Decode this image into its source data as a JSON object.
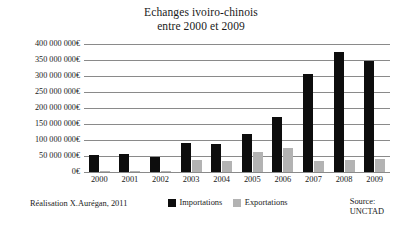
{
  "chart_data": {
    "type": "bar",
    "title": "Echanges ivoiro-chinois",
    "subtitle": "entre 2000 et 2009",
    "xlabel": "",
    "ylabel": "",
    "ylim": [
      0,
      400000000
    ],
    "ytick_step": 50000000,
    "grid": true,
    "legend_position": "bottom-center",
    "categories": [
      "2000",
      "2001",
      "2002",
      "2003",
      "2004",
      "2005",
      "2006",
      "2007",
      "2008",
      "2009"
    ],
    "ytick_labels": [
      "400 000 000€",
      "350 000 000€",
      "300 000 000€",
      "250 000 000€",
      "200 000 000€",
      "150 000 000€",
      "100 000 000€",
      "50 000 000€",
      "0€"
    ],
    "ytick_values": [
      400000000,
      350000000,
      300000000,
      250000000,
      200000000,
      150000000,
      100000000,
      50000000,
      0
    ],
    "series": [
      {
        "name": "Importations",
        "color": "#0d0d0d",
        "values": [
          53000000,
          55000000,
          47000000,
          92000000,
          88000000,
          120000000,
          172000000,
          305000000,
          375000000,
          348000000
        ]
      },
      {
        "name": "Exportations",
        "color": "#b3b3b3",
        "values": [
          3000000,
          4000000,
          3000000,
          38000000,
          33000000,
          62000000,
          75000000,
          35000000,
          38000000,
          42000000
        ]
      }
    ]
  },
  "footer": {
    "credit": "Réalisation X.Aurégan, 2011",
    "source_label": "Source:",
    "source_value": "UNCTAD"
  },
  "legend": {
    "items": [
      {
        "label": "Importations",
        "swatch": "imp"
      },
      {
        "label": "Exportations",
        "swatch": "exp"
      }
    ]
  }
}
